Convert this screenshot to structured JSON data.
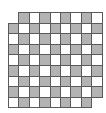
{
  "board": {
    "rows": 9,
    "cols": 9,
    "cell_width": 10.4,
    "cell_height": 10.6,
    "origin_x": 8,
    "origin_y": 12,
    "missing_cells": [
      [
        0,
        0
      ],
      [
        8,
        8
      ]
    ],
    "dark_rule": "row_plus_col_odd",
    "colors": {
      "dark": "#b3b3b3",
      "light": "#ffffff",
      "grid_line": "#5a5a5a"
    }
  }
}
